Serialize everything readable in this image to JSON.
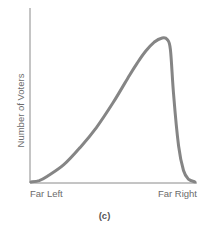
{
  "chart_data": {
    "type": "line",
    "title": "",
    "caption": "(c)",
    "xlabel": "",
    "ylabel": "Number of Voters",
    "x_tick_labels": [
      "Far Left",
      "Far Right"
    ],
    "x": [
      0,
      0.05,
      0.1,
      0.2,
      0.3,
      0.4,
      0.5,
      0.6,
      0.65,
      0.7,
      0.75,
      0.8,
      0.83,
      0.85,
      0.87,
      0.9,
      0.93,
      0.96,
      1.0
    ],
    "values": [
      0,
      0.01,
      0.04,
      0.12,
      0.24,
      0.38,
      0.55,
      0.74,
      0.83,
      0.91,
      0.97,
      1.0,
      0.99,
      0.92,
      0.6,
      0.25,
      0.08,
      0.02,
      0
    ],
    "xlim": [
      0,
      1
    ],
    "ylim": [
      0,
      1.2
    ],
    "grid": false,
    "legend": null,
    "colors": {
      "line": "#858585",
      "axis": "#8a8a8a",
      "text": "#6b6b6b"
    }
  },
  "labels": {
    "ylabel": "Number of Voters",
    "xmin": "Far Left",
    "xmax": "Far Right",
    "caption": "(c)"
  }
}
